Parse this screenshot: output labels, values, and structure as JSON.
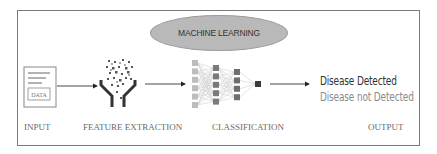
{
  "diagram": {
    "title_ellipse": "MACHINE LEARNING",
    "stages": [
      {
        "id": "input",
        "label": "INPUT",
        "icon": "document-icon",
        "doc_label": "DATA"
      },
      {
        "id": "feature-extraction",
        "label": "FEATURE EXTRACTION",
        "icon": "funnel-particles-icon"
      },
      {
        "id": "classification",
        "label": "CLASSIFICATION",
        "icon": "neural-network-icon"
      },
      {
        "id": "output",
        "label": "OUTPUT"
      }
    ],
    "outputs": {
      "positive": "Disease Detected",
      "negative": "Disease not Detected"
    },
    "colors": {
      "border": "#7a7a7a",
      "ellipse_fill": "#b9b9b9",
      "output_positive": "#333333",
      "output_negative": "#8c8c8c",
      "stage_label": "#6a6a6a"
    }
  }
}
